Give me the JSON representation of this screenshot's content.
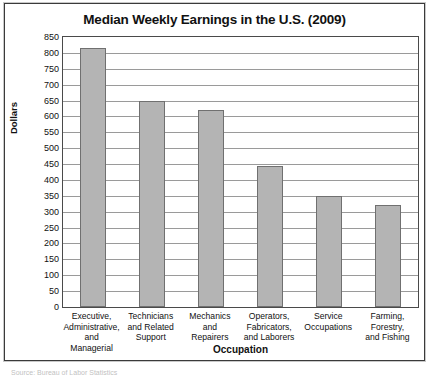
{
  "page": {
    "source_note": "Source: Bureau of Labor Statistics"
  },
  "chart_data": {
    "type": "bar",
    "title": "Median Weekly Earnings in the U.S. (2009)",
    "xlabel": "Occupation",
    "ylabel": "Dollars",
    "categories": [
      "Executive,\nAdministrative,\nand Managerial",
      "Technicians\nand Related\nSupport",
      "Mechanics\nand\nRepairers",
      "Operators,\nFabricators,\nand Laborers",
      "Service\nOccupations",
      "Farming,\nForestry,\nand Fishing"
    ],
    "values": [
      815,
      650,
      620,
      445,
      348,
      320
    ],
    "ylim": [
      0,
      850
    ],
    "ytick_step": 50,
    "yticks": [
      850,
      800,
      750,
      700,
      650,
      600,
      550,
      500,
      450,
      400,
      350,
      300,
      250,
      200,
      150,
      100,
      50,
      0
    ],
    "grid": true,
    "legend": "none",
    "bar_color": "#b4b4b4",
    "bar_border_color": "#707070",
    "grid_color": "#9a9a9a"
  }
}
